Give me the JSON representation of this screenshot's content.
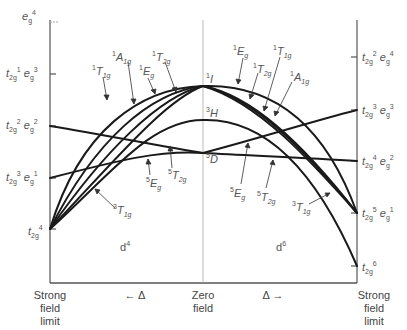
{
  "diagram": {
    "left_panel_label": "d4",
    "right_panel_label": "d6",
    "left_axis_configs": [
      {
        "t2g": "",
        "eg": "4",
        "t2g_label": "",
        "eg_label": "e",
        "y": 22
      },
      {
        "t2g": "1",
        "eg": "3",
        "y": 74
      },
      {
        "t2g": "2",
        "eg": "2",
        "y": 126
      },
      {
        "t2g": "3",
        "eg": "1",
        "y": 178
      },
      {
        "t2g": "4",
        "eg": "",
        "y": 229
      }
    ],
    "right_axis_configs": [
      {
        "t2g": "2",
        "eg": "4",
        "y": 57
      },
      {
        "t2g": "3",
        "eg": "3",
        "y": 110
      },
      {
        "t2g": "4",
        "eg": "2",
        "y": 161
      },
      {
        "t2g": "5",
        "eg": "1",
        "y": 213
      },
      {
        "t2g": "6",
        "eg": "",
        "y": 266
      }
    ],
    "free_ion_terms": [
      {
        "term": "I",
        "mult": "1",
        "y": 86
      },
      {
        "term": "H",
        "mult": "3",
        "y": 120
      },
      {
        "term": "D",
        "mult": "5",
        "y": 153
      }
    ],
    "left_state_labels": [
      {
        "mult": "1",
        "sym": "T",
        "sub": "1g"
      },
      {
        "mult": "1",
        "sym": "A",
        "sub": "1g"
      },
      {
        "mult": "1",
        "sym": "E",
        "sub": "g"
      },
      {
        "mult": "1",
        "sym": "T",
        "sub": "2g"
      },
      {
        "mult": "3",
        "sym": "T",
        "sub": "1g"
      },
      {
        "mult": "5",
        "sym": "E",
        "sub": "g"
      },
      {
        "mult": "5",
        "sym": "T",
        "sub": "2g"
      }
    ],
    "right_state_labels": [
      {
        "mult": "1",
        "sym": "E",
        "sub": "g"
      },
      {
        "mult": "1",
        "sym": "T",
        "sub": "2g"
      },
      {
        "mult": "1",
        "sym": "T",
        "sub": "1g"
      },
      {
        "mult": "1",
        "sym": "A",
        "sub": "1g"
      },
      {
        "mult": "5",
        "sym": "E",
        "sub": "g"
      },
      {
        "mult": "5",
        "sym": "T",
        "sub": "2g"
      },
      {
        "mult": "3",
        "sym": "T",
        "sub": "1g"
      }
    ],
    "x_axis": {
      "left": "Strong field limit",
      "left_lines": [
        "Strong",
        "field",
        "limit"
      ],
      "center_lines": [
        "Zero",
        "field"
      ],
      "right_lines": [
        "Strong",
        "field",
        "limit"
      ],
      "left_delta": "← Δ",
      "right_delta": "Δ →"
    },
    "colors": {
      "curve": "#1a1a1a",
      "axis": "#666666",
      "text": "#555555"
    }
  }
}
